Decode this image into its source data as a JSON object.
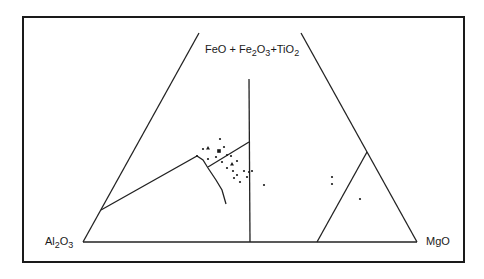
{
  "diagram": {
    "type": "ternary",
    "apex_label": {
      "parts": [
        "FeO + Fe",
        "2",
        "O",
        "3",
        "+TiO",
        "2"
      ],
      "text": "FeO + Fe2O3 + TiO2"
    },
    "left_label": {
      "parts": [
        "Al",
        "2",
        "O",
        "3"
      ],
      "text": "Al2O3"
    },
    "right_label": {
      "parts": [
        "MgO"
      ],
      "text": "MgO"
    },
    "colors": {
      "ink": "#1a1a1a",
      "background": "#ffffff"
    }
  },
  "chart_data": {
    "type": "scatter",
    "title": "",
    "vertices": [
      "FeO+Fe2O3+TiO2",
      "Al2O3",
      "MgO"
    ],
    "series": [
      {
        "name": "samples-dot",
        "marker": "dot",
        "points": [
          [
            203,
            149
          ],
          [
            220,
            139
          ],
          [
            224,
            147
          ],
          [
            216,
            157
          ],
          [
            208,
            159
          ],
          [
            197,
            156
          ],
          [
            222,
            162
          ],
          [
            227,
            155
          ],
          [
            231,
            156
          ],
          [
            237,
            161
          ],
          [
            227,
            168
          ],
          [
            233,
            171
          ],
          [
            237,
            175
          ],
          [
            244,
            171
          ],
          [
            234,
            178
          ],
          [
            240,
            182
          ],
          [
            247,
            177
          ],
          [
            249,
            172
          ],
          [
            252,
            171
          ],
          [
            264,
            185
          ],
          [
            332,
            177
          ],
          [
            332,
            184
          ],
          [
            360,
            199
          ]
        ]
      },
      {
        "name": "samples-triangle",
        "marker": "triangle",
        "points": [
          [
            208,
            148
          ],
          [
            232,
            164
          ]
        ]
      },
      {
        "name": "samples-square",
        "marker": "square",
        "points": [
          [
            219,
            151
          ]
        ]
      }
    ],
    "note": "points are given in diagram units (same frame as the triangle template), not data percentages, since no tick scale is printed"
  }
}
